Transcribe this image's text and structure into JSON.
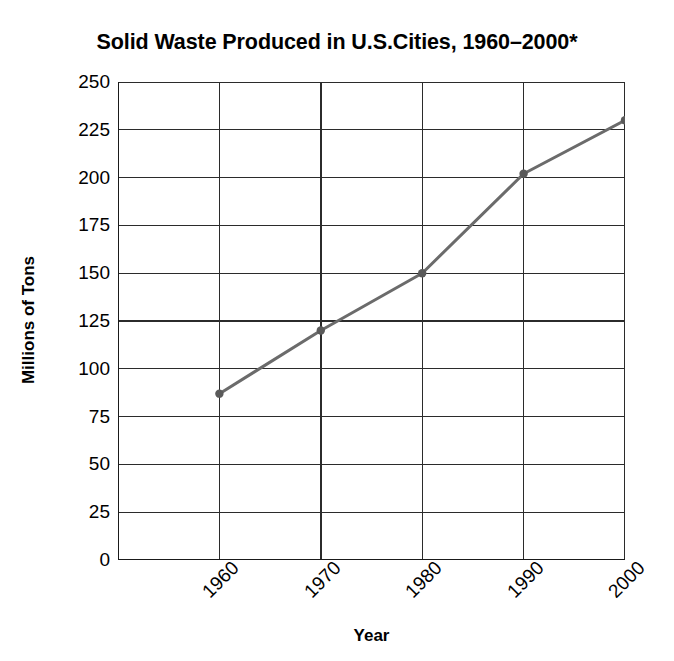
{
  "chart_data": {
    "type": "line",
    "title": "Solid Waste Produced in U.S.Cities, 1960–2000*",
    "xlabel": "Year",
    "ylabel": "Millions of Tons",
    "categories": [
      "1960",
      "1970",
      "1980",
      "1990",
      "2000"
    ],
    "x": [
      1960,
      1970,
      1980,
      1990,
      2000
    ],
    "values": [
      87,
      120,
      150,
      202,
      230
    ],
    "series": [
      {
        "name": "Solid Waste Produced",
        "values": [
          87,
          120,
          150,
          202,
          230
        ]
      }
    ],
    "ylim": [
      0,
      250
    ],
    "ytick_labels": [
      "0",
      "25",
      "50",
      "75",
      "100",
      "125",
      "150",
      "175",
      "200",
      "225",
      "250"
    ],
    "ytick_values": [
      0,
      25,
      50,
      75,
      100,
      125,
      150,
      175,
      200,
      225,
      250
    ],
    "xtick_labels": [
      "1960",
      "1970",
      "1980",
      "1990",
      "2000"
    ],
    "grid": "both",
    "legend": "none",
    "line_color": "#6b6b6b",
    "marker_color": "#5a5a5a",
    "axis_color": "#1a1a1a",
    "grid_color": "#2b2b2b",
    "background_color": "#ffffff",
    "xtick_rotation": -45
  }
}
